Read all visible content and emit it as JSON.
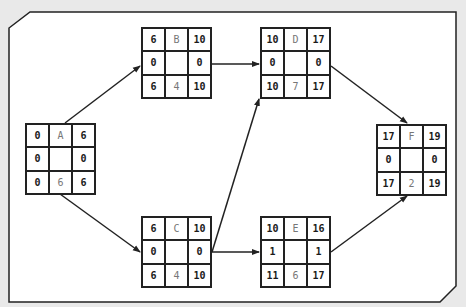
{
  "diagram": {
    "type": "activity-on-node network (critical path method)",
    "colors": {
      "background": "#e9e9e9",
      "frame": "#ffffff",
      "line": "#222222",
      "value_text": "#1a1a1a",
      "label_text": "#777777"
    },
    "nodes": [
      {
        "id": "A",
        "es": "0",
        "label": "A",
        "ef": "6",
        "tf_left": "0",
        "ff_right": "0",
        "ls": "0",
        "dur": "6",
        "lf": "6"
      },
      {
        "id": "B",
        "es": "6",
        "label": "B",
        "ef": "10",
        "tf_left": "0",
        "ff_right": "0",
        "ls": "6",
        "dur": "4",
        "lf": "10"
      },
      {
        "id": "C",
        "es": "6",
        "label": "C",
        "ef": "10",
        "tf_left": "0",
        "ff_right": "0",
        "ls": "6",
        "dur": "4",
        "lf": "10"
      },
      {
        "id": "D",
        "es": "10",
        "label": "D",
        "ef": "17",
        "tf_left": "0",
        "ff_right": "0",
        "ls": "10",
        "dur": "7",
        "lf": "17"
      },
      {
        "id": "E",
        "es": "10",
        "label": "E",
        "ef": "16",
        "tf_left": "1",
        "ff_right": "1",
        "ls": "11",
        "dur": "6",
        "lf": "17"
      },
      {
        "id": "F",
        "es": "17",
        "label": "F",
        "ef": "19",
        "tf_left": "0",
        "ff_right": "0",
        "ls": "17",
        "dur": "2",
        "lf": "19"
      }
    ],
    "edges": [
      {
        "from": "A",
        "to": "B"
      },
      {
        "from": "A",
        "to": "C"
      },
      {
        "from": "B",
        "to": "D"
      },
      {
        "from": "C",
        "to": "D"
      },
      {
        "from": "C",
        "to": "E"
      },
      {
        "from": "D",
        "to": "F"
      },
      {
        "from": "E",
        "to": "F"
      }
    ]
  }
}
